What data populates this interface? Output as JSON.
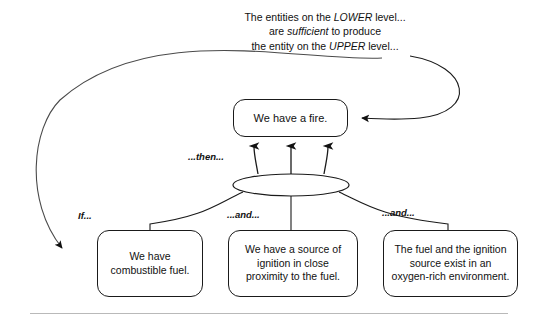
{
  "diagram": {
    "title_caption": {
      "line1_pre": "The entities on the ",
      "line1_em": "LOWER",
      "line1_post": " level...",
      "line2_pre": "are ",
      "line2_em": "sufficient",
      "line2_post": " to produce",
      "line3_pre": "the entity on the ",
      "line3_em": "UPPER",
      "line3_post": " level..."
    },
    "effect_node": {
      "text": "We have a fire."
    },
    "junction": {
      "shape_name": "and-ellipse"
    },
    "cause_nodes": [
      {
        "text": "We have combustible fuel.",
        "connector_label": "If..."
      },
      {
        "text": "We have a source of ignition in close proximity to the fuel.",
        "connector_label": "...and..."
      },
      {
        "text": "The fuel and the ignition source exist in an oxygen-rich environment.",
        "connector_label": "...and..."
      }
    ],
    "then_label": "...then...",
    "colors": {
      "stroke": "#1a1a1a",
      "text": "#111111",
      "curve": "#4a4a4a",
      "rule": "#b9b9b9",
      "background": "#ffffff"
    }
  }
}
